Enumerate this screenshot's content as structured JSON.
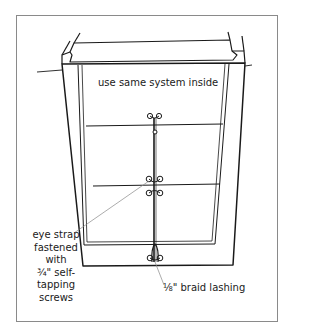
{
  "diagram": {
    "labels": {
      "top": "use same system inside",
      "left": "eye strap fastened with ¾\" self-tapping screws",
      "left_lines": [
        "eye strap",
        "fastened",
        "with",
        "¾\" self-",
        "tapping",
        "screws"
      ],
      "right": "⅛\" braid lashing"
    },
    "components": [
      "hatch frame",
      "washboards (3)",
      "eye straps",
      "braid lashing"
    ],
    "colors": {
      "line": "#1a1a1a",
      "leader": "#888888",
      "border": "#8a8a8a"
    }
  }
}
